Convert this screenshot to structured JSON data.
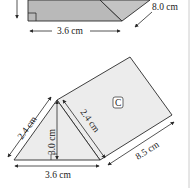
{
  "colors": {
    "shape_fill_dark": "#b9b9b9",
    "shape_fill_light": "#ececec",
    "stroke": "#2a2a2a",
    "border_line": "#cccccc"
  },
  "top_figure": {
    "width_label": "3.6 cm",
    "length_label": "8.0 cm"
  },
  "bottom_figure": {
    "face_label": "C",
    "left_slant_label": "2.4 cm",
    "right_slant_label": "2.4 cm",
    "height_label": "3.0 cm",
    "base_label": "3.6 cm",
    "length_label": "8.5 cm"
  }
}
